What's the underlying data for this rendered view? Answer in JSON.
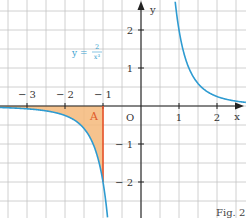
{
  "figure": {
    "caption": "Fig. 2",
    "function_label": {
      "lhs": "y =",
      "numerator": "2",
      "denominator": "x³"
    },
    "area_label": "A",
    "axes": {
      "x_label": "x",
      "y_label": "y",
      "origin_label": "O"
    },
    "x_ticks": [
      "− 3",
      "− 2",
      "− 1",
      "1",
      "2"
    ],
    "y_ticks": [
      "2",
      "1",
      "− 1",
      "− 2"
    ],
    "colors": {
      "curve": "#2e9bd1",
      "area_fill": "#f5b87a",
      "boundary_line": "#e8532a",
      "grid": "#bdbdbd",
      "axis": "#222222"
    }
  },
  "chart_data": {
    "type": "line",
    "title": "",
    "function": "y = 2/x^3",
    "xlabel": "x",
    "ylabel": "y",
    "xlim": [
      -3.7,
      2.7
    ],
    "ylim": [
      -2.9,
      2.8
    ],
    "grid": true,
    "grid_step": 0.5,
    "shaded_region": {
      "label": "A",
      "between": "curve and x-axis",
      "x_from": "-inf",
      "x_to": -1,
      "boundary_x": -1,
      "boundary_y_at_curve": -2
    },
    "series": [
      {
        "name": "y = 2/x^3 (x<0)",
        "x": [
          -3.7,
          -3,
          -2,
          -1.5,
          -1.2,
          -1,
          -0.9,
          -0.87
        ],
        "y": [
          -0.04,
          -0.074,
          -0.25,
          -0.593,
          -1.157,
          -2,
          -2.743,
          -3.04
        ]
      },
      {
        "name": "y = 2/x^3 (x>0)",
        "x": [
          0.9,
          1,
          1.25,
          1.5,
          2,
          2.5,
          2.7
        ],
        "y": [
          2.743,
          2,
          1.024,
          0.593,
          0.25,
          0.128,
          0.102
        ]
      }
    ],
    "x_ticks": [
      -3,
      -2,
      -1,
      1,
      2
    ],
    "y_ticks": [
      -2,
      -1,
      1,
      2
    ],
    "annotations": [
      "O",
      "A",
      "y = 2/x³",
      "Fig. 2"
    ]
  }
}
